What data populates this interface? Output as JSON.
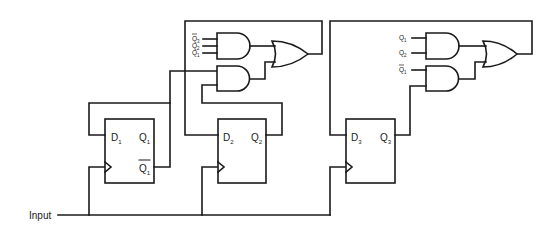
{
  "diagram": {
    "title": "",
    "input_label": "Input",
    "flip_flops": [
      {
        "id": "ff1",
        "d_label": "D",
        "d_sub": "1",
        "q_label": "Q",
        "q_sub": "1",
        "qbar_label": "Q",
        "qbar_sub": "1"
      },
      {
        "id": "ff2",
        "d_label": "D",
        "d_sub": "2",
        "q_label": "Q",
        "q_sub": "2"
      },
      {
        "id": "ff3",
        "d_label": "D",
        "d_sub": "3",
        "q_label": "Q",
        "q_sub": "3"
      }
    ],
    "logic_block_1": {
      "and_top_inputs": [
        {
          "label": "Q",
          "sub": "3",
          "complement": true
        },
        {
          "label": "Q",
          "sub": "2",
          "complement": false
        },
        {
          "label": "Q",
          "sub": "1",
          "complement": false
        }
      ],
      "gates": [
        "AND",
        "AND",
        "OR"
      ]
    },
    "logic_block_2": {
      "and_top_inputs": [
        {
          "label": "Q",
          "sub": "1",
          "complement": false
        },
        {
          "label": "Q",
          "sub": "2",
          "complement": false
        }
      ],
      "and_bottom_inputs": [
        {
          "label": "Q",
          "sub": "1",
          "complement": true
        }
      ],
      "gates": [
        "AND",
        "AND",
        "OR"
      ]
    },
    "colors": {
      "line": "#1a1a1a",
      "background": "#ffffff"
    }
  }
}
